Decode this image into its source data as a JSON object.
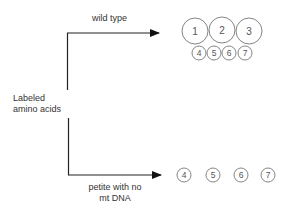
{
  "diagram": {
    "source_label_line1": "Labeled",
    "source_label_line2": "amino acids",
    "top_branch_label": "wild type",
    "bottom_branch_label_line1": "petite with no",
    "bottom_branch_label_line2": "mt DNA",
    "wild_type_large_circles": [
      "1",
      "2",
      "3"
    ],
    "wild_type_small_circles": [
      "4",
      "5",
      "6",
      "7"
    ],
    "petite_circles": [
      "4",
      "5",
      "6",
      "7"
    ],
    "colors": {
      "line": "#222222",
      "circle_stroke": "#777777",
      "text": "#333333"
    }
  }
}
